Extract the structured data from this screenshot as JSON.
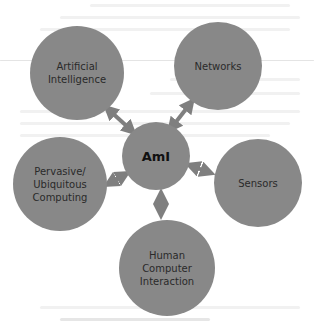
{
  "diagram": {
    "center": {
      "label": "AmI"
    },
    "nodes": [
      {
        "id": "ai",
        "label": "Artificial\nIntelligence"
      },
      {
        "id": "networks",
        "label": "Networks"
      },
      {
        "id": "sensors",
        "label": "Sensors"
      },
      {
        "id": "pervasive",
        "label": "Pervasive/\nUbiquitous\nComputing"
      },
      {
        "id": "hci",
        "label": "Human\nComputer\nInteraction"
      }
    ],
    "edges": [
      {
        "from": "AmI",
        "to": "Artificial Intelligence",
        "type": "bidirectional"
      },
      {
        "from": "AmI",
        "to": "Networks",
        "type": "bidirectional"
      },
      {
        "from": "AmI",
        "to": "Sensors",
        "type": "bidirectional"
      },
      {
        "from": "AmI",
        "to": "Pervasive/Ubiquitous Computing",
        "type": "bidirectional"
      },
      {
        "from": "AmI",
        "to": "Human Computer Interaction",
        "type": "bidirectional"
      }
    ],
    "colors": {
      "node_fill": "#888888",
      "arrow": "#7f7f7f",
      "text": "#2a2a2a"
    }
  }
}
